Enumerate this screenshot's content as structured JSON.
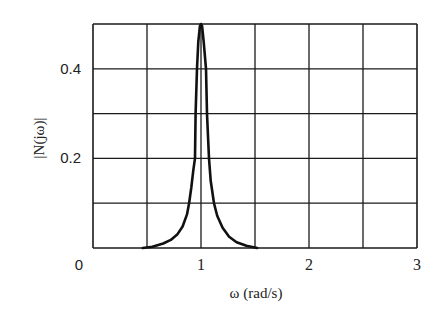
{
  "chart_data": {
    "type": "line",
    "title": "",
    "xlabel": "ω (rad/s)",
    "ylabel": "|N(jω)|",
    "xlim": [
      0,
      3
    ],
    "ylim": [
      0,
      0.5
    ],
    "grid": true,
    "x_gridlines": [
      0,
      0.5,
      1,
      1.5,
      2,
      2.5,
      3
    ],
    "y_gridlines": [
      0,
      0.1,
      0.2,
      0.3,
      0.4,
      0.5
    ],
    "x_ticks": [
      {
        "value": 0,
        "label": "0"
      },
      {
        "value": 1,
        "label": "1"
      },
      {
        "value": 2,
        "label": "2"
      },
      {
        "value": 3,
        "label": "3"
      }
    ],
    "y_ticks": [
      {
        "value": 0.2,
        "label": "0.2"
      },
      {
        "value": 0.4,
        "label": "0.4"
      }
    ],
    "legend": null,
    "series": [
      {
        "name": "|N(jω)|",
        "color": "#111111",
        "x": [
          0.46,
          0.55,
          0.65,
          0.72,
          0.78,
          0.83,
          0.87,
          0.89,
          0.91,
          0.93,
          0.944,
          0.95,
          0.963,
          0.975,
          0.99,
          1.0,
          1.01,
          1.025,
          1.046,
          1.056,
          1.074,
          1.09,
          1.12,
          1.15,
          1.2,
          1.26,
          1.33,
          1.42,
          1.52
        ],
        "y": [
          0.0,
          0.003,
          0.01,
          0.018,
          0.03,
          0.048,
          0.075,
          0.1,
          0.135,
          0.175,
          0.2,
          0.3,
          0.4,
          0.46,
          0.495,
          0.5,
          0.495,
          0.46,
          0.4,
          0.3,
          0.2,
          0.15,
          0.1,
          0.072,
          0.045,
          0.025,
          0.013,
          0.005,
          0.0
        ]
      }
    ]
  },
  "ui": {
    "xlabel": "ω (rad/s)",
    "ylabel": "|N(jω)|"
  }
}
